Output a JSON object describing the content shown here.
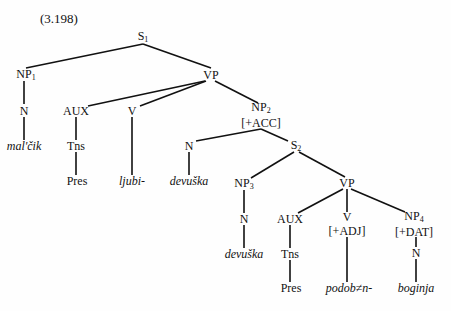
{
  "example_number": "(3.198)",
  "tree": {
    "nodes": [
      {
        "id": "S1",
        "label": "S",
        "sub": "1",
        "x": 143,
        "y": 37
      },
      {
        "id": "NP1",
        "label": "NP",
        "sub": "1",
        "x": 26,
        "y": 75
      },
      {
        "id": "VP1",
        "label": "VP",
        "sub": "",
        "x": 211,
        "y": 75
      },
      {
        "id": "N1",
        "label": "N",
        "sub": "",
        "x": 24,
        "y": 111
      },
      {
        "id": "malcik",
        "label": "mal'čik",
        "sub": "",
        "x": 24,
        "y": 146,
        "word": true
      },
      {
        "id": "AUX1",
        "label": "AUX",
        "sub": "",
        "x": 76,
        "y": 111
      },
      {
        "id": "Tns1",
        "label": "Tns",
        "sub": "",
        "x": 76,
        "y": 146
      },
      {
        "id": "Pres1",
        "label": "Pres",
        "sub": "",
        "x": 77,
        "y": 181
      },
      {
        "id": "V1",
        "label": "V",
        "sub": "",
        "x": 132,
        "y": 111
      },
      {
        "id": "ljubi",
        "label": "ljubi-",
        "sub": "",
        "x": 132,
        "y": 181,
        "word": true
      },
      {
        "id": "NP2",
        "label": "NP",
        "sub": "2",
        "feature": "[+ACC]",
        "x": 261,
        "y": 115
      },
      {
        "id": "N2",
        "label": "N",
        "sub": "",
        "x": 189,
        "y": 146
      },
      {
        "id": "devuska1",
        "label": "devuška",
        "sub": "",
        "x": 189,
        "y": 181,
        "word": true
      },
      {
        "id": "S2",
        "label": "S",
        "sub": "2",
        "x": 296,
        "y": 146
      },
      {
        "id": "NP3",
        "label": "NP",
        "sub": "3",
        "x": 244,
        "y": 184
      },
      {
        "id": "N3",
        "label": "N",
        "sub": "",
        "x": 244,
        "y": 219
      },
      {
        "id": "devuska2",
        "label": "devuška",
        "sub": "",
        "x": 244,
        "y": 254,
        "word": true
      },
      {
        "id": "VP2",
        "label": "VP",
        "sub": "",
        "x": 347,
        "y": 183
      },
      {
        "id": "AUX2",
        "label": "AUX",
        "sub": "",
        "x": 290,
        "y": 219
      },
      {
        "id": "Tns2",
        "label": "Tns",
        "sub": "",
        "x": 290,
        "y": 254
      },
      {
        "id": "Pres2",
        "label": "Pres",
        "sub": "",
        "x": 291,
        "y": 288
      },
      {
        "id": "V2",
        "label": "V",
        "sub": "",
        "feature": "[+ADJ]",
        "x": 347,
        "y": 224
      },
      {
        "id": "podob",
        "label": "podob≠n-",
        "sub": "",
        "x": 349,
        "y": 288,
        "word": true
      },
      {
        "id": "NP4",
        "label": "NP",
        "sub": "4",
        "feature": "[+DAT]",
        "x": 414,
        "y": 224
      },
      {
        "id": "N4",
        "label": "N",
        "sub": "",
        "x": 416,
        "y": 253
      },
      {
        "id": "boginja",
        "label": "boginja",
        "sub": "",
        "x": 416,
        "y": 288,
        "word": true
      }
    ],
    "edges": [
      [
        143,
        44,
        26,
        68
      ],
      [
        143,
        44,
        211,
        68
      ],
      [
        24,
        81,
        24,
        104
      ],
      [
        24,
        117,
        24,
        140
      ],
      [
        205,
        81,
        88,
        106
      ],
      [
        206,
        81,
        140,
        106
      ],
      [
        215,
        81,
        258,
        103
      ],
      [
        76,
        117,
        76,
        140
      ],
      [
        76,
        152,
        76,
        175
      ],
      [
        132,
        117,
        132,
        175
      ],
      [
        261,
        129,
        196,
        141
      ],
      [
        261,
        129,
        288,
        141
      ],
      [
        189,
        152,
        189,
        175
      ],
      [
        294,
        152,
        251,
        178
      ],
      [
        299,
        152,
        345,
        177
      ],
      [
        244,
        190,
        244,
        213
      ],
      [
        244,
        225,
        244,
        248
      ],
      [
        343,
        189,
        298,
        213
      ],
      [
        347,
        189,
        347,
        212
      ],
      [
        351,
        189,
        405,
        212
      ],
      [
        290,
        225,
        290,
        248
      ],
      [
        290,
        260,
        290,
        282
      ],
      [
        347,
        237,
        347,
        282
      ],
      [
        416,
        237,
        416,
        247
      ],
      [
        416,
        259,
        416,
        282
      ]
    ]
  }
}
